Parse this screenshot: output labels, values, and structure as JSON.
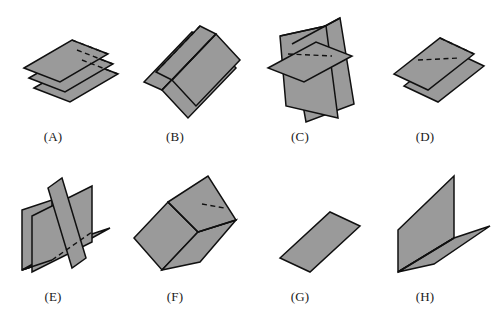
{
  "figure_set": {
    "title": "",
    "background_color": "#ffffff",
    "plane_fill_color": "#9a9a9a",
    "edge_color": "#101010",
    "hidden_edge_style": "dashed",
    "columns": 4,
    "rows": 2,
    "figures": [
      {
        "id": "A",
        "label": "(A)",
        "description": "three parallel horizontal planes stacked vertically",
        "plane_count": 3,
        "configuration": "parallel",
        "label_x": 53,
        "label_y": 129
      },
      {
        "id": "B",
        "label": "(B)",
        "description": "two parallel folded V-shaped surfaces nested",
        "plane_count": 4,
        "configuration": "parallel-folded",
        "label_x": 175,
        "label_y": 129
      },
      {
        "id": "C",
        "label": "(C)",
        "description": "two intersecting vertical planes crossed by a horizontal plane",
        "plane_count": 3,
        "configuration": "intersecting",
        "label_x": 300,
        "label_y": 129
      },
      {
        "id": "D",
        "label": "(D)",
        "description": "two parallel planes",
        "plane_count": 2,
        "configuration": "parallel",
        "label_x": 425,
        "label_y": 129
      },
      {
        "id": "E",
        "label": "(E)",
        "description": "V-shaped trough intersected by a perpendicular vertical plane",
        "plane_count": 3,
        "configuration": "intersecting",
        "label_x": 53,
        "label_y": 289
      },
      {
        "id": "F",
        "label": "(F)",
        "description": "V-shaped trough with an upright plane along the fold line",
        "plane_count": 3,
        "configuration": "common-edge",
        "label_x": 175,
        "label_y": 289
      },
      {
        "id": "G",
        "label": "(G)",
        "description": "single plane",
        "plane_count": 1,
        "configuration": "single",
        "label_x": 300,
        "label_y": 289
      },
      {
        "id": "H",
        "label": "(H)",
        "description": "two perpendicular planes meeting along a common edge forming an L dihedral",
        "plane_count": 2,
        "configuration": "perpendicular",
        "label_x": 425,
        "label_y": 289
      }
    ]
  }
}
